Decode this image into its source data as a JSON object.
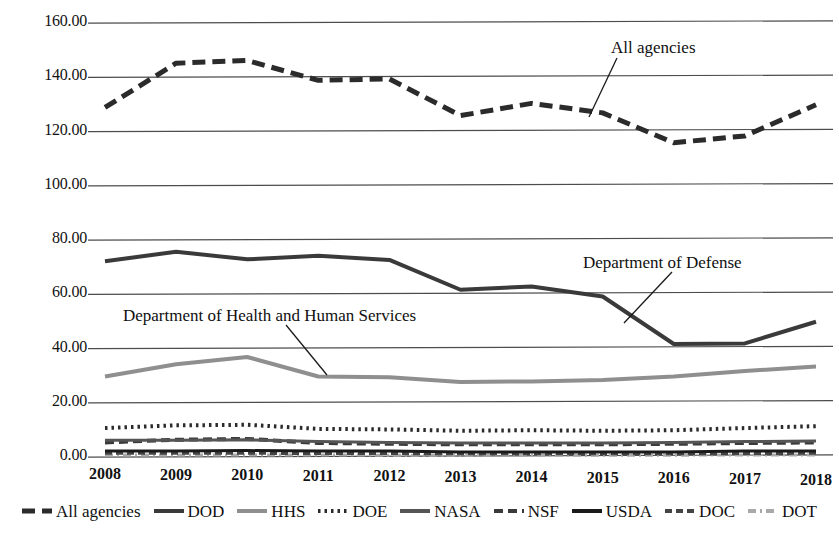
{
  "chart_data": {
    "type": "line",
    "title": "",
    "subtitle": "",
    "xlabel": "",
    "ylabel": "",
    "categories": [
      "2008",
      "2009",
      "2010",
      "2011",
      "2012",
      "2013",
      "2014",
      "2015",
      "2016",
      "2017",
      "2018"
    ],
    "x": [
      2008,
      2009,
      2010,
      2011,
      2012,
      2013,
      2014,
      2015,
      2016,
      2017,
      2018
    ],
    "ylim": [
      0.0,
      160.0
    ],
    "xlim": [
      2008,
      2018
    ],
    "yticks": [
      0.0,
      20.0,
      40.0,
      60.0,
      80.0,
      100.0,
      120.0,
      140.0,
      160.0
    ],
    "ytick_labels": [
      "0.00",
      "20.00",
      "40.00",
      "60.00",
      "80.00",
      "100.00",
      "120.00",
      "140.00",
      "160.00"
    ],
    "grid": true,
    "grid_axis": "y",
    "legend_position": "bottom",
    "series": [
      {
        "name": "All agencies",
        "values": [
          128.5,
          144.8,
          145.8,
          138.5,
          139.0,
          125.5,
          130.0,
          126.5,
          115.5,
          118.0,
          129.5
        ],
        "color": "#2b2b2b",
        "dash": "13,7",
        "width": 5
      },
      {
        "name": "DOD",
        "values": [
          71.8,
          75.3,
          72.5,
          73.8,
          72.3,
          61.3,
          62.5,
          58.8,
          41.3,
          41.5,
          49.5
        ],
        "color": "#3a3a3a",
        "dash": "none",
        "width": 4
      },
      {
        "name": "HHS",
        "values": [
          29.3,
          33.8,
          36.5,
          29.3,
          29.0,
          27.3,
          27.5,
          28.0,
          29.3,
          31.3,
          33.0
        ],
        "color": "#8f8f8f",
        "dash": "none",
        "width": 4
      },
      {
        "name": "DOE",
        "values": [
          10.3,
          11.3,
          11.5,
          10.0,
          9.8,
          9.3,
          9.5,
          9.3,
          9.5,
          10.3,
          11.0
        ],
        "color": "#2b2b2b",
        "dash": "2.5,4",
        "width": 4
      },
      {
        "name": "NASA",
        "values": [
          5.8,
          5.8,
          6.0,
          5.3,
          5.0,
          4.8,
          4.8,
          4.8,
          5.0,
          5.3,
          5.5
        ],
        "color": "#555555",
        "dash": "none",
        "width": 3
      },
      {
        "name": "NSF",
        "values": [
          5.0,
          6.0,
          6.3,
          4.8,
          4.5,
          4.3,
          4.3,
          4.3,
          4.5,
          4.8,
          5.0
        ],
        "color": "#3a3a3a",
        "dash": "9,5",
        "width": 4
      },
      {
        "name": "USDA",
        "values": [
          1.8,
          1.8,
          2.0,
          1.8,
          1.8,
          1.5,
          1.5,
          1.5,
          1.5,
          1.8,
          1.8
        ],
        "color": "#1a1a1a",
        "dash": "none",
        "width": 3
      },
      {
        "name": "DOC",
        "values": [
          1.0,
          1.0,
          1.0,
          0.9,
          0.9,
          0.8,
          0.8,
          0.8,
          0.8,
          0.9,
          1.0
        ],
        "color": "#444444",
        "dash": "7,4",
        "width": 3
      },
      {
        "name": "DOT",
        "values": [
          0.4,
          0.4,
          0.4,
          0.4,
          0.3,
          0.3,
          0.3,
          0.3,
          0.3,
          0.4,
          0.4
        ],
        "color": "#a9a9a9",
        "dash": "8,4,2,4",
        "width": 3
      }
    ],
    "annotations": [
      {
        "text": "All agencies",
        "x": 2015.0,
        "y": 150.0
      },
      {
        "text": "Department of Defense",
        "x": 2014.6,
        "y": 66.0
      },
      {
        "text": "Department of Health and Human Services",
        "x": 2009.0,
        "y": 45.5
      }
    ]
  },
  "legend": {
    "items": [
      {
        "label": "All agencies"
      },
      {
        "label": "DOD"
      },
      {
        "label": "HHS"
      },
      {
        "label": "DOE"
      },
      {
        "label": "NASA"
      },
      {
        "label": "NSF"
      },
      {
        "label": "USDA"
      },
      {
        "label": "DOC"
      },
      {
        "label": "DOT"
      }
    ]
  },
  "axis": {
    "y_labels": [
      "160.00",
      "140.00",
      "120.00",
      "100.00",
      "80.00",
      "60.00",
      "40.00",
      "20.00",
      "0.00"
    ],
    "x_labels": [
      "2008",
      "2009",
      "2010",
      "2011",
      "2012",
      "2013",
      "2014",
      "2015",
      "2016",
      "2017",
      "2018"
    ]
  },
  "annotations": {
    "all_agencies": "All agencies",
    "dod": "Department of Defense",
    "hhs": "Department of Health and Human Services"
  },
  "colors": {
    "gridline": "#4d4d4d",
    "background": "#ffffff",
    "text": "#101010"
  }
}
